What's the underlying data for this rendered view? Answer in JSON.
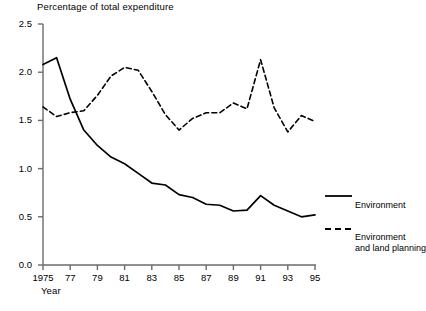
{
  "chart_data": {
    "type": "line",
    "title": "Percentage of total expenditure",
    "xlabel": "Year",
    "ylabel": "",
    "xlim": [
      1975,
      1995
    ],
    "ylim": [
      0.0,
      2.5
    ],
    "grid": false,
    "legend_position": "right",
    "x": [
      1975,
      1976,
      1977,
      1978,
      1979,
      1980,
      1981,
      1982,
      1983,
      1984,
      1985,
      1986,
      1987,
      1988,
      1989,
      1990,
      1991,
      1992,
      1993,
      1994,
      1995
    ],
    "xtick_labels": [
      "1975",
      "77",
      "79",
      "81",
      "83",
      "85",
      "87",
      "89",
      "91",
      "93",
      "95"
    ],
    "xtick_values": [
      1975,
      1977,
      1979,
      1981,
      1983,
      1985,
      1987,
      1989,
      1991,
      1993,
      1995
    ],
    "ytick_labels": [
      "0.0",
      "0.5",
      "1.0",
      "1.5",
      "2.0",
      "2.5"
    ],
    "ytick_values": [
      0.0,
      0.5,
      1.0,
      1.5,
      2.0,
      2.5
    ],
    "series": [
      {
        "name": "Environment",
        "style": "solid",
        "color": "#000000",
        "values": [
          2.08,
          2.15,
          1.72,
          1.4,
          1.24,
          1.12,
          1.05,
          0.95,
          0.85,
          0.83,
          0.73,
          0.7,
          0.63,
          0.62,
          0.56,
          0.57,
          0.72,
          0.62,
          0.56,
          0.5,
          0.52
        ]
      },
      {
        "name": "Environment and land planning",
        "style": "dashed",
        "color": "#000000",
        "values": [
          1.64,
          1.54,
          1.58,
          1.6,
          1.76,
          1.96,
          2.05,
          2.02,
          1.8,
          1.56,
          1.4,
          1.52,
          1.58,
          1.58,
          1.68,
          1.62,
          2.13,
          1.63,
          1.38,
          1.55,
          1.49
        ]
      }
    ]
  },
  "legend": {
    "entries": [
      {
        "label_line1": "Environment",
        "label_line2": ""
      },
      {
        "label_line1": "Environment",
        "label_line2": "and land planning"
      }
    ]
  }
}
